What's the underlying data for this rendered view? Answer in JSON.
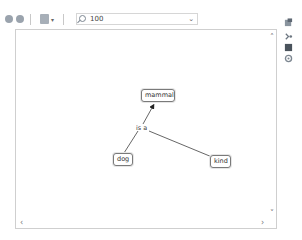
{
  "toolbar": {
    "back_icon": "back-arrow-icon",
    "forward_icon": "forward-arrow-icon",
    "layout_icon": "layout-menu-icon",
    "zoom": {
      "icon": "magnifier-icon",
      "value": "100",
      "dropdown_icon": "chevron-down-icon"
    }
  },
  "side_panel": {
    "icons": [
      "style-icon",
      "connector-icon",
      "fill-color-icon",
      "settings-icon"
    ]
  },
  "diagram": {
    "nodes": [
      {
        "id": "mammal",
        "label": "mammal"
      },
      {
        "id": "dog",
        "label": "dog"
      },
      {
        "id": "kind",
        "label": "kind"
      }
    ],
    "link_label": "is a",
    "links": [
      {
        "from": "dog",
        "to": "mammal",
        "via": "is a"
      },
      {
        "from": "kind",
        "to": "is a"
      }
    ]
  },
  "scrollbars": {
    "up": "˄",
    "down": "˅",
    "left": "‹",
    "right": "›"
  },
  "colors": {
    "node_border": "#7a7a7a",
    "link_line": "#555555",
    "canvas_border": "#cfcfcf"
  }
}
